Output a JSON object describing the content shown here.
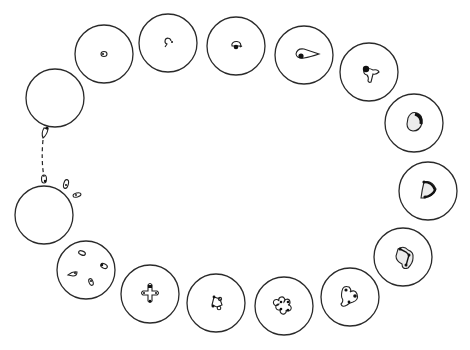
{
  "figure": {
    "description": "Life cycle of an intracellular blood parasite shown as a ring of circular cells, stage by stage",
    "stages": [
      {
        "id": "entry",
        "label": "sporozoite entering cell",
        "cx": 55,
        "cy": 98
      },
      {
        "id": "ring-1",
        "label": "early ring stage",
        "cx": 104,
        "cy": 54
      },
      {
        "id": "ring-2",
        "label": "ring with tail",
        "cx": 168,
        "cy": 43
      },
      {
        "id": "ring-3",
        "label": "ring with dark nucleus",
        "cx": 236,
        "cy": 46
      },
      {
        "id": "troph-1",
        "label": "elongated trophozoite",
        "cx": 304,
        "cy": 55
      },
      {
        "id": "troph-2",
        "label": "amoeboid trophozoite",
        "cx": 369,
        "cy": 72
      },
      {
        "id": "troph-3",
        "label": "stippled trophozoite",
        "cx": 414,
        "cy": 123
      },
      {
        "id": "schizont-1",
        "label": "early schizont (D-shape)",
        "cx": 428,
        "cy": 191
      },
      {
        "id": "schizont-2",
        "label": "dividing schizont",
        "cx": 403,
        "cy": 257
      },
      {
        "id": "schizont-3",
        "label": "three-lobed schizont",
        "cx": 350,
        "cy": 297
      },
      {
        "id": "schizont-4",
        "label": "four-lobed schizont",
        "cx": 284,
        "cy": 306
      },
      {
        "id": "schizont-5",
        "label": "four nuclei ring",
        "cx": 216,
        "cy": 303
      },
      {
        "id": "schizont-6",
        "label": "cruciform division",
        "cx": 150,
        "cy": 294
      },
      {
        "id": "merozoites",
        "label": "four merozoites in cell",
        "cx": 86,
        "cy": 270
      },
      {
        "id": "release",
        "label": "released merozoites",
        "cx": 44,
        "cy": 215
      }
    ],
    "connector": {
      "type": "dashed",
      "from": "entry",
      "to": "release"
    }
  }
}
